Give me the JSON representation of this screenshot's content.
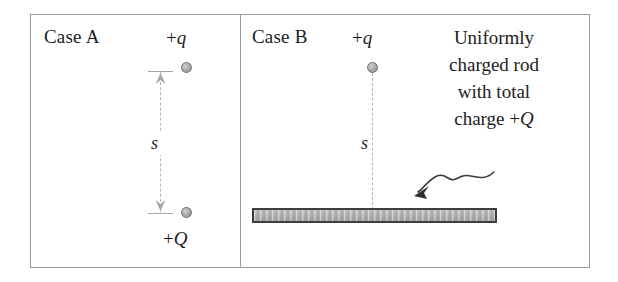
{
  "figure": {
    "background_color": "#ffffff",
    "frame_color": "#9a9a9a"
  },
  "case_a": {
    "label": "Case A",
    "top_charge_label_sign": "+",
    "top_charge_label_symbol": "q",
    "bottom_charge_label_sign": "+",
    "bottom_charge_label_symbol": "Q",
    "distance_label": "s",
    "dot_color": "#a8a8a8",
    "dot_border_color": "#6f6f6f",
    "arrow_color": "#a5a5a5"
  },
  "case_b": {
    "label": "Case B",
    "top_charge_label_sign": "+",
    "top_charge_label_symbol": "q",
    "distance_label": "s",
    "rod_fill_color": "#b0b0b0",
    "rod_border_color": "#3d3d3d",
    "annotation_lines": [
      "Uniformly",
      "charged rod",
      "with total"
    ],
    "annotation_last_line_prefix": "charge +",
    "annotation_last_line_symbol": "Q",
    "pointer_color": "#3a3a3a"
  }
}
